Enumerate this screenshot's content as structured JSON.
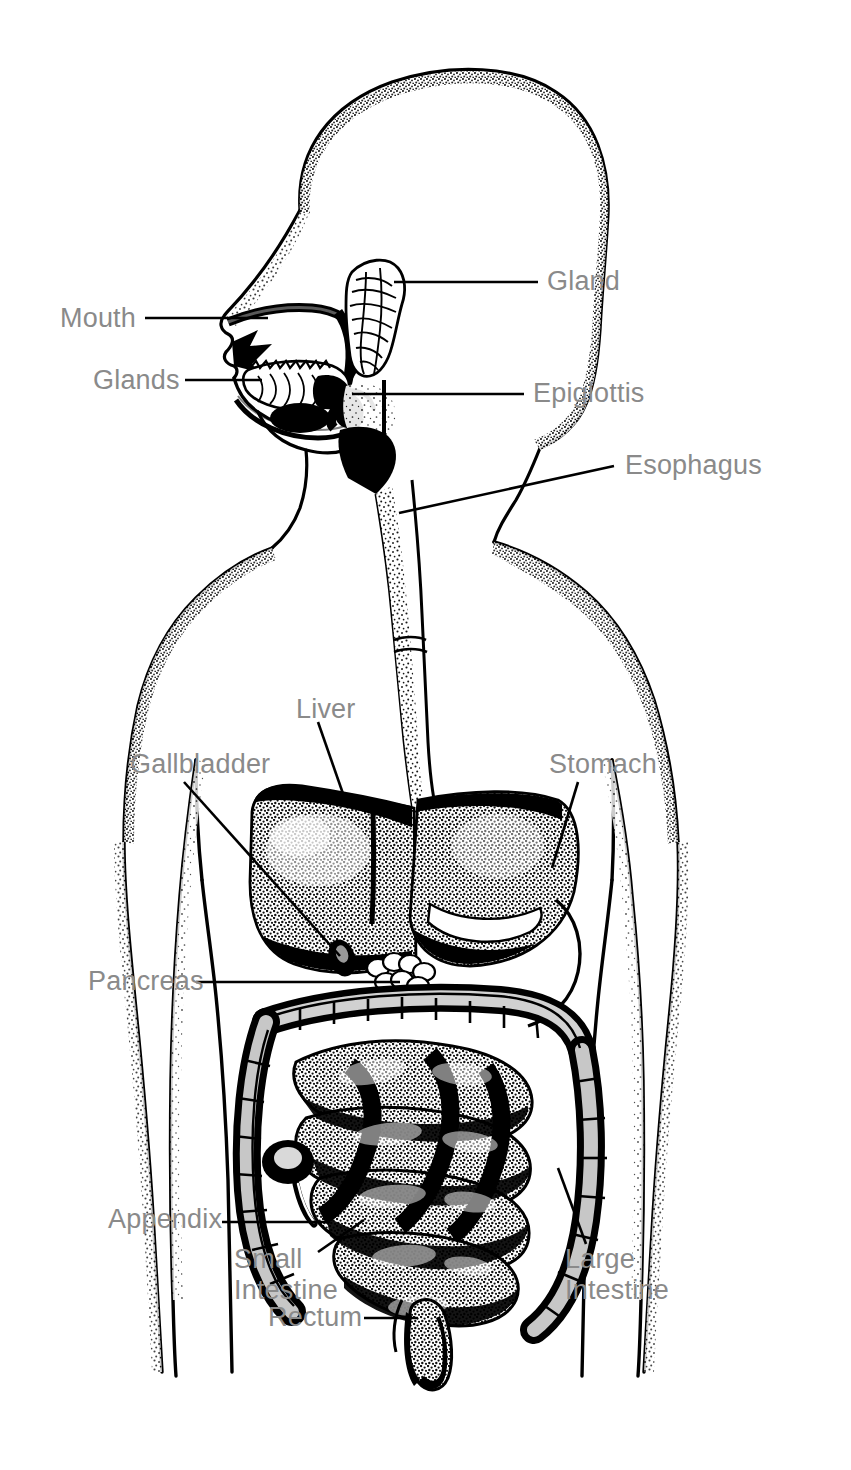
{
  "diagram": {
    "style": "black-and-white stippled pen-and-ink medical illustration",
    "background_color": "#ffffff",
    "ink_color": "#000000",
    "label_color": "#8a8a8a",
    "leader_line_color": "#000000",
    "canvas": {
      "width": 851,
      "height": 1470
    }
  },
  "labels": [
    {
      "id": "mouth",
      "text": "Mouth",
      "align": "left",
      "x": 60,
      "y": 303,
      "leader": "horizontal"
    },
    {
      "id": "glands",
      "text": "Glands",
      "align": "left",
      "x": 93,
      "y": 365,
      "leader": "horizontal"
    },
    {
      "id": "gland",
      "text": "Gland",
      "align": "left",
      "x": 547,
      "y": 266,
      "leader": "horizontal"
    },
    {
      "id": "epiglottis",
      "text": "Epiglottis",
      "align": "left",
      "x": 533,
      "y": 378,
      "leader": "horizontal"
    },
    {
      "id": "esophagus",
      "text": "Esophagus",
      "align": "left",
      "x": 625,
      "y": 450,
      "leader": "diagonal"
    },
    {
      "id": "liver",
      "text": "Liver",
      "align": "left",
      "x": 296,
      "y": 694,
      "leader": "diagonal"
    },
    {
      "id": "gallbladder",
      "text": "Gallbladder",
      "align": "left",
      "x": 130,
      "y": 749,
      "leader": "diagonal"
    },
    {
      "id": "stomach",
      "text": "Stomach",
      "align": "left",
      "x": 549,
      "y": 749,
      "leader": "diagonal"
    },
    {
      "id": "pancreas",
      "text": "Pancreas",
      "align": "left",
      "x": 88,
      "y": 966,
      "leader": "horizontal"
    },
    {
      "id": "appendix",
      "text": "Appendix",
      "align": "left",
      "x": 108,
      "y": 1218,
      "leader": "horizontal"
    },
    {
      "id": "small-intestine",
      "text": "Small\nIntestine",
      "align": "left",
      "x": 234,
      "y": 1258,
      "leader": "diagonal"
    },
    {
      "id": "large-intestine",
      "text": "Large\nIntestine",
      "align": "left",
      "x": 565,
      "y": 1258,
      "leader": "diagonal"
    },
    {
      "id": "rectum",
      "text": "Rectum",
      "align": "left",
      "x": 268,
      "y": 1302,
      "leader": "horizontal"
    }
  ],
  "organs": [
    {
      "id": "mouth-cavity",
      "name": "Mouth / oral cavity"
    },
    {
      "id": "salivary-glands",
      "name": "Salivary glands"
    },
    {
      "id": "parotid-gland",
      "name": "Parotid gland"
    },
    {
      "id": "epiglottis-flap",
      "name": "Epiglottis"
    },
    {
      "id": "esophagus-tube",
      "name": "Esophagus"
    },
    {
      "id": "liver-organ",
      "name": "Liver"
    },
    {
      "id": "gallbladder-organ",
      "name": "Gallbladder"
    },
    {
      "id": "stomach-organ",
      "name": "Stomach"
    },
    {
      "id": "pancreas-organ",
      "name": "Pancreas"
    },
    {
      "id": "small-intestine-organ",
      "name": "Small intestine"
    },
    {
      "id": "large-intestine-organ",
      "name": "Large intestine / colon"
    },
    {
      "id": "appendix-organ",
      "name": "Appendix"
    },
    {
      "id": "rectum-organ",
      "name": "Rectum"
    }
  ]
}
